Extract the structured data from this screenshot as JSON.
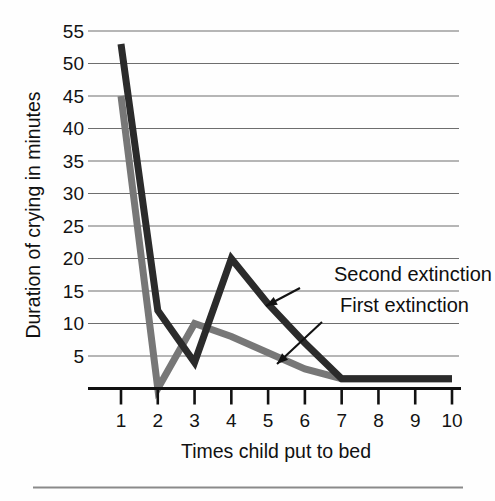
{
  "figure": {
    "background_color": "#fefefe",
    "bottom_rule_color": "#8a8a8a"
  },
  "chart_data": {
    "type": "line",
    "title": "",
    "subtitle": "",
    "xlabel": "Times child put to bed",
    "ylabel": "Duration of crying in minutes",
    "x": [
      1,
      2,
      3,
      4,
      5,
      6,
      7,
      8,
      9,
      10
    ],
    "categories": [
      "1",
      "2",
      "3",
      "4",
      "5",
      "6",
      "7",
      "8",
      "9",
      "10"
    ],
    "xtick_labels": [
      "1",
      "2",
      "3",
      "4",
      "5",
      "6",
      "7",
      "8",
      "9",
      "10"
    ],
    "ytick_labels": [
      "55",
      "50",
      "45",
      "40",
      "35",
      "30",
      "25",
      "20",
      "15",
      "10",
      "5"
    ],
    "yticks": [
      55,
      50,
      45,
      40,
      35,
      30,
      25,
      20,
      15,
      10,
      5
    ],
    "xlim": [
      1,
      10
    ],
    "ylim": [
      0,
      57
    ],
    "grid": true,
    "grid_axis": "y",
    "grid_color": "#6e6e6e",
    "legend": "none",
    "legend_position": "inline-annotations",
    "series": [
      {
        "name": "First extinction",
        "color": "#777777",
        "line_width": 7,
        "values": [
          45,
          0,
          10,
          8,
          5.5,
          3,
          1.5,
          1.5,
          1.5,
          1.5
        ]
      },
      {
        "name": "Second extinction",
        "color": "#2b2b2b",
        "line_width": 7,
        "values": [
          53,
          12,
          4,
          20,
          13,
          7,
          1.5,
          1.5,
          1.5,
          1.5
        ]
      }
    ],
    "annotations": [
      {
        "text": "Second extinction",
        "target_series": "Second extinction",
        "text_x": 334,
        "text_y": 281,
        "arrow_from_x": 300,
        "arrow_from_y": 288,
        "arrow_to_x": 266,
        "arrow_to_y": 306
      },
      {
        "text": "First extinction",
        "target_series": "First extinction",
        "text_x": 340,
        "text_y": 312,
        "arrow_from_x": 322,
        "arrow_from_y": 322,
        "arrow_to_x": 277,
        "arrow_to_y": 364
      }
    ]
  }
}
